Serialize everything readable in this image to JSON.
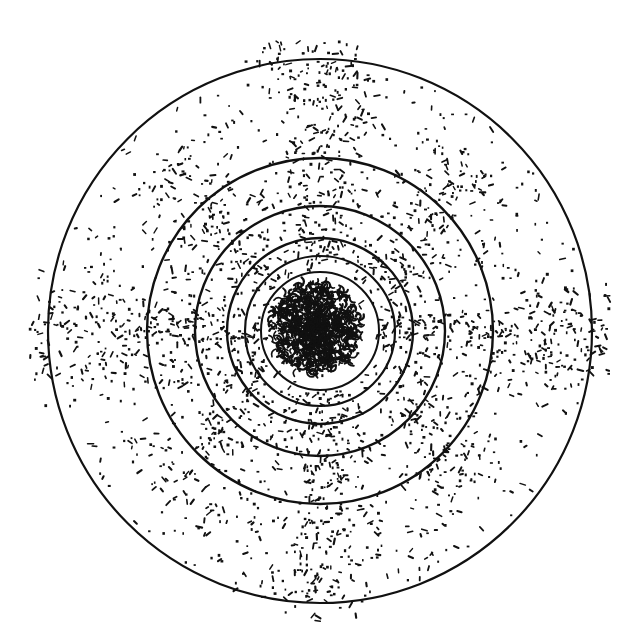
{
  "diagram": {
    "type": "concentric-circle scatter pattern",
    "width": 627,
    "height": 628,
    "background": "#ffffff",
    "ink_color": "#111111",
    "center": {
      "x": 320,
      "y": 331
    },
    "rings": [
      {
        "r": 272,
        "stroke_width": 2.2
      },
      {
        "r": 173,
        "stroke_width": 2.4
      },
      {
        "r": 125,
        "stroke_width": 2.4
      },
      {
        "r": 93,
        "stroke_width": 2.4
      },
      {
        "r": 75,
        "stroke_width": 2.2
      },
      {
        "r": 59,
        "stroke_width": 2.0
      }
    ],
    "core_blob": {
      "cx": 316,
      "cy": 328,
      "r": 46,
      "density": 900
    },
    "scatter": {
      "seed": 7,
      "background_dots": 700,
      "arms": [
        {
          "angle_deg": 0,
          "count": 260,
          "spread": 28,
          "r_min": 60,
          "r_max": 290
        },
        {
          "angle_deg": 90,
          "count": 260,
          "spread": 28,
          "r_min": 60,
          "r_max": 290
        },
        {
          "angle_deg": 180,
          "count": 260,
          "spread": 28,
          "r_min": 60,
          "r_max": 290
        },
        {
          "angle_deg": 270,
          "count": 280,
          "spread": 28,
          "r_min": 60,
          "r_max": 290
        },
        {
          "angle_deg": 45,
          "count": 160,
          "spread": 30,
          "r_min": 60,
          "r_max": 230
        },
        {
          "angle_deg": 135,
          "count": 160,
          "spread": 30,
          "r_min": 60,
          "r_max": 230
        },
        {
          "angle_deg": 225,
          "count": 160,
          "spread": 30,
          "r_min": 60,
          "r_max": 230
        },
        {
          "angle_deg": 315,
          "count": 160,
          "spread": 30,
          "r_min": 60,
          "r_max": 230
        }
      ]
    }
  }
}
